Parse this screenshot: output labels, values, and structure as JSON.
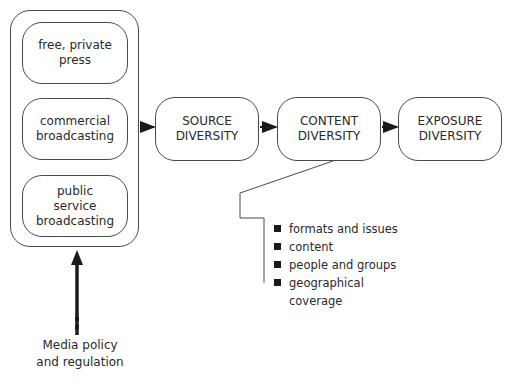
{
  "diagram": {
    "outer_group": {
      "items": [
        {
          "label": "free, private\npress"
        },
        {
          "label": "commercial\nbroadcasting"
        },
        {
          "label": "public\nservice\nbroadcasting"
        }
      ]
    },
    "flow": [
      {
        "label": "SOURCE\nDIVERSITY"
      },
      {
        "label": "CONTENT\nDIVERSITY"
      },
      {
        "label": "EXPOSURE\nDIVERSITY"
      }
    ],
    "content_aspects": [
      "formats and issues",
      "content",
      "people and groups",
      "geographical\ncoverage"
    ],
    "input": {
      "label": "Media policy\nand regulation"
    },
    "colors": {
      "stroke": "#4a4a4a",
      "arrow": "#1a1a1a",
      "text": "#2a2a2a"
    }
  }
}
